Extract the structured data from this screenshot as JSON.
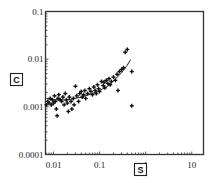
{
  "chart_data": {
    "type": "scatter",
    "title": "",
    "xlabel": "S",
    "ylabel": "C",
    "x_scale": "log",
    "y_scale": "log",
    "xlim": [
      0.0067,
      18
    ],
    "ylim": [
      0.0001,
      0.1
    ],
    "x_ticks": [
      "0.01",
      "0.1",
      "1",
      "10"
    ],
    "y_ticks": [
      "0.1",
      "0.01",
      "0.001",
      "0.0001"
    ],
    "grid": false,
    "legend": null,
    "values_note": "Approximate values estimated from pixel positions; figure has no data labels.",
    "series": [
      {
        "name": "observations",
        "marker": "plus",
        "points": [
          [
            0.007,
            0.0011
          ],
          [
            0.0075,
            0.0013
          ],
          [
            0.008,
            0.0012
          ],
          [
            0.0085,
            0.0015
          ],
          [
            0.009,
            0.0011
          ],
          [
            0.0095,
            0.0014
          ],
          [
            0.01,
            0.0012
          ],
          [
            0.0105,
            0.0017
          ],
          [
            0.011,
            0.0013
          ],
          [
            0.0115,
            0.0009
          ],
          [
            0.012,
            0.00065
          ],
          [
            0.0125,
            0.0015
          ],
          [
            0.013,
            0.0018
          ],
          [
            0.014,
            0.0014
          ],
          [
            0.015,
            0.0013
          ],
          [
            0.016,
            0.0016
          ],
          [
            0.017,
            0.0011
          ],
          [
            0.018,
            0.0019
          ],
          [
            0.019,
            0.0014
          ],
          [
            0.02,
            0.0012
          ],
          [
            0.021,
            0.0008
          ],
          [
            0.022,
            0.0016
          ],
          [
            0.024,
            0.0013
          ],
          [
            0.025,
            0.0009
          ],
          [
            0.027,
            0.0015
          ],
          [
            0.028,
            0.0011
          ],
          [
            0.03,
            0.0027
          ],
          [
            0.032,
            0.0017
          ],
          [
            0.035,
            0.0013
          ],
          [
            0.037,
            0.0019
          ],
          [
            0.04,
            0.0021
          ],
          [
            0.042,
            0.0016
          ],
          [
            0.045,
            0.0018
          ],
          [
            0.048,
            0.0022
          ],
          [
            0.05,
            0.0015
          ],
          [
            0.055,
            0.0019
          ],
          [
            0.06,
            0.0024
          ],
          [
            0.065,
            0.0021
          ],
          [
            0.07,
            0.0018
          ],
          [
            0.075,
            0.0026
          ],
          [
            0.08,
            0.0022
          ],
          [
            0.085,
            0.0019
          ],
          [
            0.09,
            0.0029
          ],
          [
            0.095,
            0.0024
          ],
          [
            0.1,
            0.0021
          ],
          [
            0.11,
            0.0034
          ],
          [
            0.12,
            0.0028
          ],
          [
            0.125,
            0.0033
          ],
          [
            0.13,
            0.0025
          ],
          [
            0.14,
            0.0036
          ],
          [
            0.15,
            0.0031
          ],
          [
            0.16,
            0.0039
          ],
          [
            0.17,
            0.0029
          ],
          [
            0.18,
            0.0034
          ],
          [
            0.2,
            0.0042
          ],
          [
            0.22,
            0.0036
          ],
          [
            0.24,
            0.0048
          ],
          [
            0.25,
            0.0022
          ],
          [
            0.27,
            0.0055
          ],
          [
            0.3,
            0.0061
          ],
          [
            0.33,
            0.0066
          ],
          [
            0.36,
            0.014
          ],
          [
            0.4,
            0.016
          ],
          [
            0.5,
            0.0055
          ],
          [
            0.5,
            0.00105
          ]
        ]
      },
      {
        "name": "trend",
        "type": "line",
        "points": [
          [
            0.007,
            0.0015
          ],
          [
            0.01,
            0.0014
          ],
          [
            0.02,
            0.0014
          ],
          [
            0.04,
            0.0016
          ],
          [
            0.07,
            0.0019
          ],
          [
            0.1,
            0.0022
          ],
          [
            0.15,
            0.0027
          ],
          [
            0.2,
            0.0035
          ],
          [
            0.3,
            0.0052
          ],
          [
            0.4,
            0.0075
          ],
          [
            0.47,
            0.0098
          ]
        ]
      }
    ]
  },
  "axes": {
    "x_label_box": "S",
    "y_label_box": "C",
    "x_tick_labels": [
      "0.01",
      "0.1",
      "1",
      "10"
    ],
    "y_tick_labels": [
      "0.1",
      "0.01",
      "0.001",
      "0.0001"
    ]
  }
}
